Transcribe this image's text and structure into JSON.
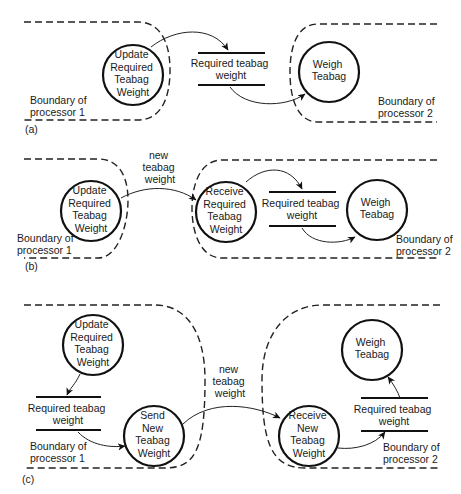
{
  "diagram": {
    "panels": [
      {
        "label": "(a)",
        "processes": [
          {
            "id": "update",
            "lines": [
              "Update",
              "Required",
              "Teabag",
              "Weight"
            ]
          },
          {
            "id": "weigh",
            "lines": [
              "Weigh",
              "Teabag"
            ]
          }
        ],
        "stores": [
          {
            "id": "store",
            "lines": [
              "Required teabag",
              "weight"
            ]
          }
        ],
        "boundaries": [
          {
            "id": "b1",
            "lines": [
              "Boundary of",
              "processor 1"
            ]
          },
          {
            "id": "b2",
            "lines": [
              "Boundary of",
              "processor 2"
            ]
          }
        ],
        "flows": [
          {
            "from": "update",
            "to": "store",
            "label": ""
          },
          {
            "from": "store",
            "to": "weigh",
            "label": ""
          }
        ]
      },
      {
        "label": "(b)",
        "processes": [
          {
            "id": "update",
            "lines": [
              "Update",
              "Required",
              "Teabag",
              "Weight"
            ]
          },
          {
            "id": "receive",
            "lines": [
              "Receive",
              "Required",
              "Teabag",
              "Weight"
            ]
          },
          {
            "id": "weigh",
            "lines": [
              "Weigh",
              "Teabag"
            ]
          }
        ],
        "stores": [
          {
            "id": "store",
            "lines": [
              "Required teabag",
              "weight"
            ]
          }
        ],
        "boundaries": [
          {
            "id": "b1",
            "lines": [
              "Boundary of",
              "processor 1"
            ]
          },
          {
            "id": "b2",
            "lines": [
              "Boundary of",
              "processor 2"
            ]
          }
        ],
        "flows": [
          {
            "from": "update",
            "to": "receive",
            "label": "new teabag weight",
            "label_lines": [
              "new",
              "teabag",
              "weight"
            ]
          },
          {
            "from": "receive",
            "to": "store",
            "label": ""
          },
          {
            "from": "store",
            "to": "weigh",
            "label": ""
          }
        ]
      },
      {
        "label": "(c)",
        "processes": [
          {
            "id": "update",
            "lines": [
              "Update",
              "Required",
              "Teabag",
              "Weight"
            ]
          },
          {
            "id": "send",
            "lines": [
              "Send",
              "New",
              "Teabag",
              "Weight"
            ]
          },
          {
            "id": "receive",
            "lines": [
              "Receive",
              "New",
              "Teabag",
              "Weight"
            ]
          },
          {
            "id": "weigh",
            "lines": [
              "Weigh",
              "Teabag"
            ]
          }
        ],
        "stores": [
          {
            "id": "store1",
            "lines": [
              "Required teabag",
              "weight"
            ]
          },
          {
            "id": "store2",
            "lines": [
              "Required teabag",
              "weight"
            ]
          }
        ],
        "boundaries": [
          {
            "id": "b1",
            "lines": [
              "Boundary of",
              "processor 1"
            ]
          },
          {
            "id": "b2",
            "lines": [
              "Boundary of",
              "processor 2"
            ]
          }
        ],
        "flows": [
          {
            "from": "update",
            "to": "store1",
            "label": ""
          },
          {
            "from": "store1",
            "to": "send",
            "label": ""
          },
          {
            "from": "send",
            "to": "receive",
            "label": "new teabag weight",
            "label_lines": [
              "new",
              "teabag",
              "weight"
            ]
          },
          {
            "from": "receive",
            "to": "store2",
            "label": ""
          },
          {
            "from": "store2",
            "to": "weigh",
            "label": ""
          }
        ]
      }
    ]
  }
}
